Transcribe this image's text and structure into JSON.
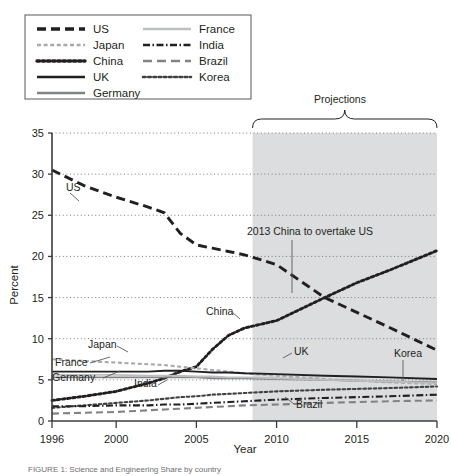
{
  "figure": {
    "caption": "FIGURE   1:  Science and Engineering Share by country",
    "legend": {
      "column_left": [
        {
          "label": "US",
          "style": "dashed-long",
          "color": "#231f20"
        },
        {
          "label": "Japan",
          "style": "dotted-dash",
          "color": "#a7a9ac"
        },
        {
          "label": "China",
          "style": "dotted",
          "color": "#231f20"
        },
        {
          "label": "UK",
          "style": "solid",
          "color": "#231f20"
        },
        {
          "label": "Germany",
          "style": "solid",
          "color": "#808285"
        }
      ],
      "column_right": [
        {
          "label": "France",
          "style": "solid",
          "color": "#bcbec0"
        },
        {
          "label": "India",
          "style": "dash-dot",
          "color": "#231f20"
        },
        {
          "label": "Brazil",
          "style": "dashed-long",
          "color": "#808285"
        },
        {
          "label": "Korea",
          "style": "dotted",
          "color": "#414042"
        }
      ]
    },
    "annotations": [
      {
        "name": "projections-bracket-label",
        "text": "Projections"
      },
      {
        "name": "crossover-note",
        "text": "2013 China to overtake US"
      }
    ],
    "series_labels": [
      {
        "name": "US",
        "text": "US"
      },
      {
        "name": "China",
        "text": "China"
      },
      {
        "name": "Japan",
        "text": "Japan"
      },
      {
        "name": "France",
        "text": "France"
      },
      {
        "name": "Germany",
        "text": "Germany"
      },
      {
        "name": "India",
        "text": "India"
      },
      {
        "name": "UK",
        "text": "UK"
      },
      {
        "name": "Korea",
        "text": "Korea"
      },
      {
        "name": "Brazil",
        "text": "Brazil"
      }
    ]
  },
  "chart_data": {
    "type": "line",
    "title": "",
    "xlabel": "Year",
    "ylabel": "Percent",
    "xlim": [
      1996,
      2020
    ],
    "ylim": [
      0,
      35
    ],
    "yticks": [
      0,
      5,
      10,
      15,
      20,
      25,
      30,
      35
    ],
    "xticks": [
      1996,
      2000,
      2005,
      2010,
      2015,
      2020
    ],
    "grid": "horizontal-dotted",
    "legend_position": "top-left-box",
    "shaded_region": {
      "label": "Projections",
      "x_start": 2008.5,
      "x_end": 2020
    },
    "x": [
      1996,
      1998,
      2000,
      2002,
      2003,
      2004,
      2005,
      2006,
      2007,
      2008,
      2010,
      2013,
      2015,
      2017,
      2020
    ],
    "series": [
      {
        "name": "US",
        "values": [
          30.5,
          28.6,
          27.2,
          26.0,
          25.3,
          22.8,
          21.4,
          21.0,
          20.6,
          20.2,
          19.0,
          15.0,
          13.2,
          11.4,
          8.6
        ]
      },
      {
        "name": "China",
        "values": [
          2.5,
          3.0,
          3.6,
          4.6,
          5.2,
          6.0,
          6.6,
          8.7,
          10.4,
          11.3,
          12.2,
          15.0,
          16.8,
          18.3,
          20.7
        ]
      },
      {
        "name": "Japan",
        "values": [
          7.5,
          7.3,
          7.1,
          6.9,
          6.8,
          6.6,
          6.4,
          6.2,
          6.0,
          5.8,
          5.5,
          5.1,
          4.9,
          4.7,
          4.5
        ]
      },
      {
        "name": "UK",
        "values": [
          6.0,
          6.0,
          6.0,
          6.0,
          6.1,
          6.1,
          6.0,
          5.9,
          5.9,
          5.8,
          5.7,
          5.5,
          5.4,
          5.3,
          5.1
        ]
      },
      {
        "name": "Germany",
        "values": [
          5.3,
          5.3,
          5.3,
          5.3,
          5.3,
          5.3,
          5.3,
          5.2,
          5.2,
          5.2,
          5.1,
          5.0,
          4.9,
          4.8,
          4.7
        ]
      },
      {
        "name": "France",
        "values": [
          5.6,
          5.6,
          5.6,
          5.5,
          5.5,
          5.5,
          5.4,
          5.4,
          5.3,
          5.3,
          5.2,
          5.0,
          4.9,
          4.8,
          4.6
        ]
      },
      {
        "name": "Korea",
        "values": [
          1.6,
          1.9,
          2.2,
          2.5,
          2.7,
          2.9,
          3.0,
          3.2,
          3.3,
          3.4,
          3.6,
          3.8,
          3.9,
          4.0,
          4.2
        ]
      },
      {
        "name": "India",
        "values": [
          1.8,
          1.8,
          1.9,
          1.9,
          2.0,
          2.0,
          2.1,
          2.2,
          2.3,
          2.4,
          2.6,
          2.8,
          2.9,
          3.0,
          3.2
        ]
      },
      {
        "name": "Brazil",
        "values": [
          0.9,
          1.0,
          1.1,
          1.3,
          1.4,
          1.5,
          1.6,
          1.7,
          1.8,
          1.9,
          2.0,
          2.2,
          2.3,
          2.4,
          2.5
        ]
      }
    ]
  }
}
